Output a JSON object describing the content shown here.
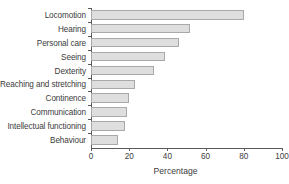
{
  "chart_data": {
    "type": "bar",
    "orientation": "horizontal",
    "title": "",
    "subtitle": "",
    "xlabel": "Percentage",
    "ylabel": "",
    "xlim": [
      0,
      100
    ],
    "xticks": [
      0,
      20,
      40,
      60,
      80,
      100
    ],
    "xtick_labels": [
      "0",
      "20",
      "40",
      "60",
      "80",
      "100"
    ],
    "grid": false,
    "legend": null,
    "categories": [
      "Locomotion",
      "Hearing",
      "Personal care",
      "Seeing",
      "Dexterity",
      "Reaching and stretching",
      "Continence",
      "Communication",
      "Intellectual functioning",
      "Behaviour"
    ],
    "values": [
      80,
      52,
      46,
      39,
      33,
      23,
      20,
      19,
      18,
      14
    ],
    "bar_fill_color": "#dedede",
    "bar_border_color": "#a9a9a9",
    "axis_color": "#5a5a5a",
    "text_color": "#3c3c3c",
    "background_color": "#ffffff"
  }
}
